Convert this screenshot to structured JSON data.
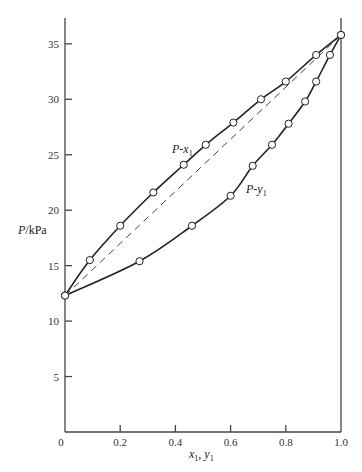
{
  "chart_data": {
    "type": "line",
    "title": "",
    "xlabel": "x1, y1",
    "ylabel": "P/kPa",
    "xlim": [
      0,
      1.0
    ],
    "ylim": [
      0,
      37
    ],
    "x_ticks": [
      0,
      0.2,
      0.4,
      0.6,
      0.8,
      1.0
    ],
    "x_tick_labels": [
      "0",
      "0.2",
      "0.4",
      "0.6",
      "0.8",
      "1.0"
    ],
    "y_ticks": [
      5,
      10,
      15,
      20,
      25,
      30,
      35
    ],
    "y_tick_labels": [
      "5",
      "10",
      "15",
      "20",
      "25",
      "30",
      "35"
    ],
    "grid": false,
    "series": [
      {
        "name": "P-x1",
        "label_text": "P-x",
        "label_sub": "1",
        "style": "solid",
        "markers": "open-circle",
        "x": [
          0.0,
          0.09,
          0.2,
          0.32,
          0.43,
          0.51,
          0.61,
          0.71,
          0.8,
          0.91,
          1.0
        ],
        "y": [
          12.3,
          15.5,
          18.6,
          21.6,
          24.1,
          25.9,
          27.9,
          30.0,
          31.6,
          34.0,
          35.8
        ]
      },
      {
        "name": "P-y1",
        "label_text": "P-y",
        "label_sub": "1",
        "style": "solid",
        "markers": "open-circle",
        "x": [
          0.0,
          0.27,
          0.46,
          0.6,
          0.68,
          0.75,
          0.81,
          0.87,
          0.91,
          0.96,
          1.0
        ],
        "y": [
          12.3,
          15.4,
          18.6,
          21.3,
          24.0,
          25.9,
          27.8,
          29.8,
          31.6,
          34.0,
          35.8
        ]
      },
      {
        "name": "Raoult's law (linear)",
        "style": "dashed",
        "markers": "none",
        "x": [
          0.0,
          1.0
        ],
        "y": [
          12.3,
          35.8
        ]
      }
    ]
  },
  "labels": {
    "ylabel_italic": "P",
    "ylabel_rest": "/kPa",
    "xlabel_x": "x",
    "xlabel_sub1": "1",
    "xlabel_sep": ", ",
    "xlabel_y": "y",
    "xlabel_sub2": "1"
  }
}
